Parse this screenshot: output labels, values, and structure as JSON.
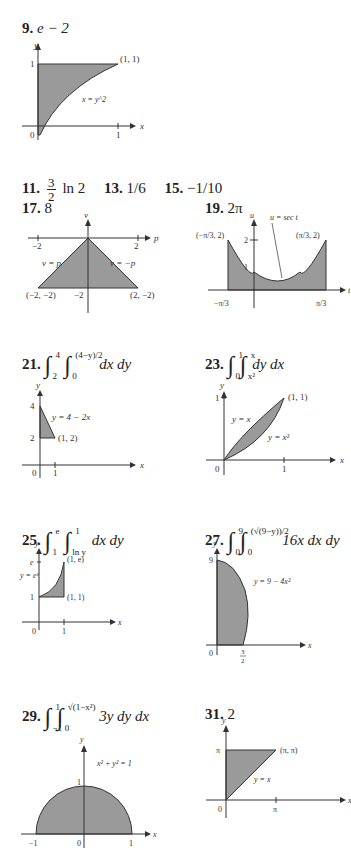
{
  "answers": {
    "p9": {
      "number": "9.",
      "value": "e − 2",
      "graph": {
        "region": "x = y^2",
        "point": "(1, 1)",
        "ticks_x": [
          "0",
          "1"
        ],
        "ticks_y": [
          "1"
        ],
        "axis_x": "x",
        "axis_y": "y"
      }
    },
    "p11": {
      "number": "11.",
      "frac_num": "3",
      "frac_den": "2",
      "rest": "ln 2"
    },
    "p13": {
      "number": "13.",
      "value": "1/6"
    },
    "p15": {
      "number": "15.",
      "value": "−1/10"
    },
    "p17": {
      "number": "17.",
      "value": "8",
      "graph": {
        "axis_x": "p",
        "axis_y": "v",
        "left_line": "v = p",
        "right_line": "v = −p",
        "pt_left": "(−2, −2)",
        "pt_right": "(2, −2)",
        "tick_x_neg": "−2",
        "tick_x_pos": "2",
        "tick_y": "−2"
      }
    },
    "p19": {
      "number": "19.",
      "value": "2π",
      "graph": {
        "axis_x": "t",
        "axis_y": "u",
        "curve": "u = sec t",
        "pt_left": "(−π/3, 2)",
        "pt_right": "(π/3, 2)",
        "tick_y2": "2",
        "tick_y1": "1",
        "tick_x_neg": "−π/3",
        "tick_x_pos": "π/3"
      }
    },
    "p21": {
      "number": "21.",
      "lower_outer": "2",
      "upper_outer": "4",
      "lower_inner": "0",
      "upper_inner": "(4−y)/2",
      "diff": "dx dy",
      "graph": {
        "line": "y = 4 − 2x",
        "point": "(1, 2)",
        "tick_y4": "4",
        "tick_y2": "2",
        "tick_x0": "0",
        "tick_x1": "1",
        "axis_x": "x",
        "axis_y": "y"
      }
    },
    "p23": {
      "number": "23.",
      "lower_outer": "0",
      "upper_outer": "1",
      "lower_inner": "x²",
      "upper_inner": "x",
      "diff": "dy dx",
      "graph": {
        "line": "y = x",
        "curve": "y = x²",
        "point": "(1, 1)",
        "tick_y1": "1",
        "tick_x0": "0",
        "tick_x1": "1",
        "axis_x": "x",
        "axis_y": "y"
      }
    },
    "p25": {
      "number": "25.",
      "lower_outer": "1",
      "upper_outer": "e",
      "lower_inner": "ln y",
      "upper_inner": "1",
      "diff": "dx dy",
      "graph": {
        "curve": "y = eˣ",
        "pt_top": "(1, e)",
        "pt_bottom": "(1, 1)",
        "tick_ye": "e",
        "tick_y1": "1",
        "tick_x0": "0",
        "tick_x1": "1",
        "axis_x": "x",
        "axis_y": "y"
      }
    },
    "p27": {
      "number": "27.",
      "lower_outer": "0",
      "upper_outer": "9",
      "lower_inner": "0",
      "upper_inner": "(√(9−y))/2",
      "integrand": "16x dx dy",
      "graph": {
        "curve": "y = 9 − 4x²",
        "tick_y9": "9",
        "tick_x0": "0",
        "tick_x_num": "3",
        "tick_x_den": "2",
        "axis_x": "x",
        "axis_y": "y"
      }
    },
    "p29": {
      "number": "29.",
      "lower_outer": "−1",
      "upper_outer": "1",
      "lower_inner": "0",
      "upper_inner": "√(1−x²)",
      "integrand": "3y dy dx",
      "graph": {
        "curve": "x² + y² = 1",
        "tick_y1": "1",
        "tick_xn1": "−1",
        "tick_x0": "0",
        "tick_x1": "1",
        "axis_x": "x",
        "axis_y": "y"
      }
    },
    "p31": {
      "number": "31.",
      "value": "2",
      "graph": {
        "line": "y = x",
        "point": "(π, π)",
        "tick_ypi": "π",
        "tick_xpi": "π",
        "tick_x0": "0",
        "axis_x": "x",
        "axis_y": "y"
      }
    }
  },
  "colors": {
    "fill": "#9a9a9a",
    "stroke": "#333333"
  }
}
